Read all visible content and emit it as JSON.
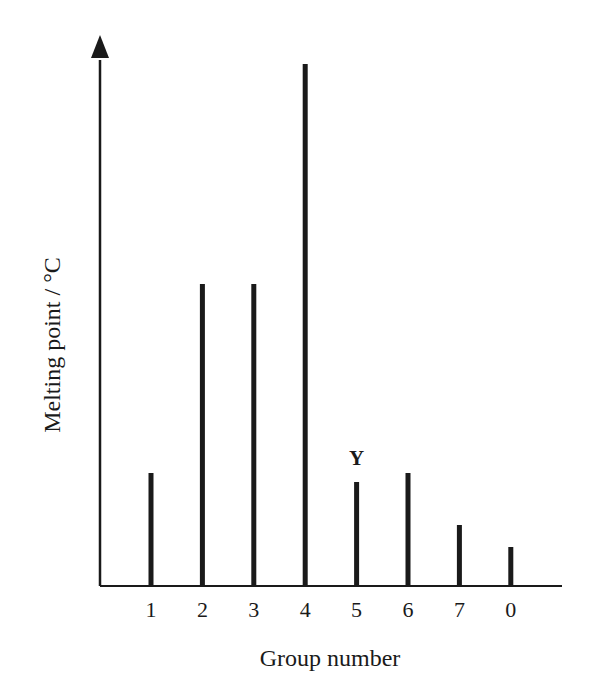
{
  "chart_data": {
    "type": "bar",
    "title": "",
    "xlabel": "Group number",
    "ylabel": "Melting point / °C",
    "categories": [
      "1",
      "2",
      "3",
      "4",
      "5",
      "6",
      "7",
      "0"
    ],
    "values": [
      113,
      302,
      302,
      522,
      104,
      113,
      61,
      39
    ],
    "value_units": "relative (no y-axis tick values shown)",
    "ylim": [
      0,
      540
    ],
    "grid": false,
    "legend": null,
    "annotations": [
      {
        "category": "5",
        "text": "Y"
      }
    ]
  },
  "colors": {
    "bar": "#1a1a1a",
    "axis": "#1a1a1a",
    "background": "#ffffff"
  }
}
